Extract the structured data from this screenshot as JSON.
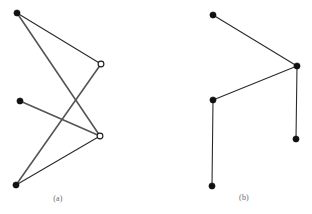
{
  "figure": {
    "background_color": "#ffffff",
    "width": 312,
    "height": 214,
    "style": {
      "edge_color": "#2b2b2b",
      "edge_color_light": "#555555",
      "edge_width": 1.1,
      "filled_node_color": "#111111",
      "open_node_fill": "#ffffff",
      "open_node_stroke": "#1a1a1a",
      "filled_node_radius": 3.1,
      "open_node_radius": 2.9,
      "caption_color": "#6a6a6a"
    },
    "panels": [
      {
        "id": "a",
        "caption": "(a)",
        "nodes": [
          {
            "id": "a1",
            "label": "top-left-filled",
            "type": "filled",
            "x": 17,
            "y": 13
          },
          {
            "id": "a2",
            "label": "mid-left-filled",
            "type": "filled",
            "x": 20,
            "y": 101
          },
          {
            "id": "a3",
            "label": "bottom-left-filled",
            "type": "filled",
            "x": 16,
            "y": 185
          },
          {
            "id": "a4",
            "label": "upper-right-open",
            "type": "open",
            "x": 101,
            "y": 64
          },
          {
            "id": "a5",
            "label": "lower-right-open",
            "type": "open",
            "x": 100,
            "y": 136
          }
        ],
        "edges": [
          {
            "from": "a1",
            "to": "a4",
            "weight": "thin"
          },
          {
            "from": "a1",
            "to": "a5",
            "weight": "thick"
          },
          {
            "from": "a2",
            "to": "a5",
            "weight": "thick"
          },
          {
            "from": "a3",
            "to": "a4",
            "weight": "thick"
          },
          {
            "from": "a3",
            "to": "a5",
            "weight": "thin"
          }
        ]
      },
      {
        "id": "b",
        "caption": "(b)",
        "nodes": [
          {
            "id": "b1",
            "label": "top-filled",
            "type": "filled",
            "x": 213,
            "y": 15
          },
          {
            "id": "b2",
            "label": "right-junction-filled",
            "type": "filled",
            "x": 297,
            "y": 66
          },
          {
            "id": "b3",
            "label": "left-middle-filled",
            "type": "filled",
            "x": 213,
            "y": 100
          },
          {
            "id": "b4",
            "label": "bottom-left-filled",
            "type": "filled",
            "x": 212,
            "y": 186
          },
          {
            "id": "b5",
            "label": "bottom-right-filled",
            "type": "filled",
            "x": 296,
            "y": 139
          }
        ],
        "edges": [
          {
            "from": "b1",
            "to": "b2",
            "weight": "thin"
          },
          {
            "from": "b2",
            "to": "b3",
            "weight": "thin"
          },
          {
            "from": "b3",
            "to": "b4",
            "weight": "thin"
          },
          {
            "from": "b2",
            "to": "b5",
            "weight": "thin"
          }
        ]
      }
    ]
  }
}
